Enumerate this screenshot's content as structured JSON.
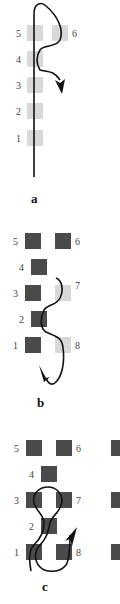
{
  "figure": {
    "panels": [
      {
        "id": "a",
        "label": "a",
        "nodes": [
          {
            "number": "1",
            "state": "light"
          },
          {
            "number": "2",
            "state": "light"
          },
          {
            "number": "3",
            "state": "light"
          },
          {
            "number": "4",
            "state": "light"
          },
          {
            "number": "5",
            "state": "light"
          },
          {
            "number": "6",
            "state": "light"
          }
        ],
        "path_description": "Vertical line rising through nodes 1-5, looping over 5 and 6, returning down with an arrow pointing down-right"
      },
      {
        "id": "b",
        "label": "b",
        "nodes": [
          {
            "number": "1",
            "state": "dark"
          },
          {
            "number": "2",
            "state": "dark"
          },
          {
            "number": "3",
            "state": "dark"
          },
          {
            "number": "4",
            "state": "dark"
          },
          {
            "number": "5",
            "state": "dark"
          },
          {
            "number": "6",
            "state": "dark"
          },
          {
            "number": "7",
            "state": "light"
          },
          {
            "number": "8",
            "state": "light"
          }
        ],
        "path_description": "Curve starting near node 7, weaving around node 2, passing 8 and ending with an arrow pointing up-left below node 1"
      },
      {
        "id": "c",
        "label": "c",
        "nodes": [
          {
            "number": "1",
            "state": "dark"
          },
          {
            "number": "2",
            "state": "dark"
          },
          {
            "number": "3",
            "state": "dark"
          },
          {
            "number": "4",
            "state": "dark"
          },
          {
            "number": "5",
            "state": "dark"
          },
          {
            "number": "6",
            "state": "dark"
          },
          {
            "number": "7",
            "state": "dark"
          },
          {
            "number": "8",
            "state": "dark"
          }
        ],
        "path_description": "Loop rising from below node 1 through node 2, circling around nodes 3 and 7, descending past 8 and ending with an arrow pointing up-right"
      }
    ],
    "colors": {
      "light_node": "#d9d9d9",
      "dark_node": "#4a4a4a",
      "path": "#111111",
      "label": "#444444"
    }
  }
}
